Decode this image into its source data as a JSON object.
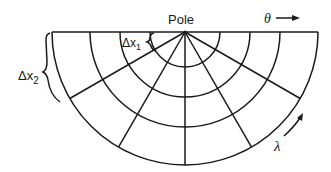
{
  "figure": {
    "type": "polar-grid-half-disk",
    "pole_label": "Pole",
    "theta_label": "θ",
    "lambda_label": "λ",
    "dx1_label": "Δx",
    "dx1_sub": "1",
    "dx2_label": "Δx",
    "dx2_sub": "2",
    "pole": {
      "x": 185,
      "y": 32
    },
    "ring_radii": [
      35,
      65,
      95,
      133
    ],
    "spoke_angles_deg": [
      30,
      60,
      90,
      120,
      150
    ],
    "line_color": "#1a1a1a",
    "background": "#ffffff"
  }
}
